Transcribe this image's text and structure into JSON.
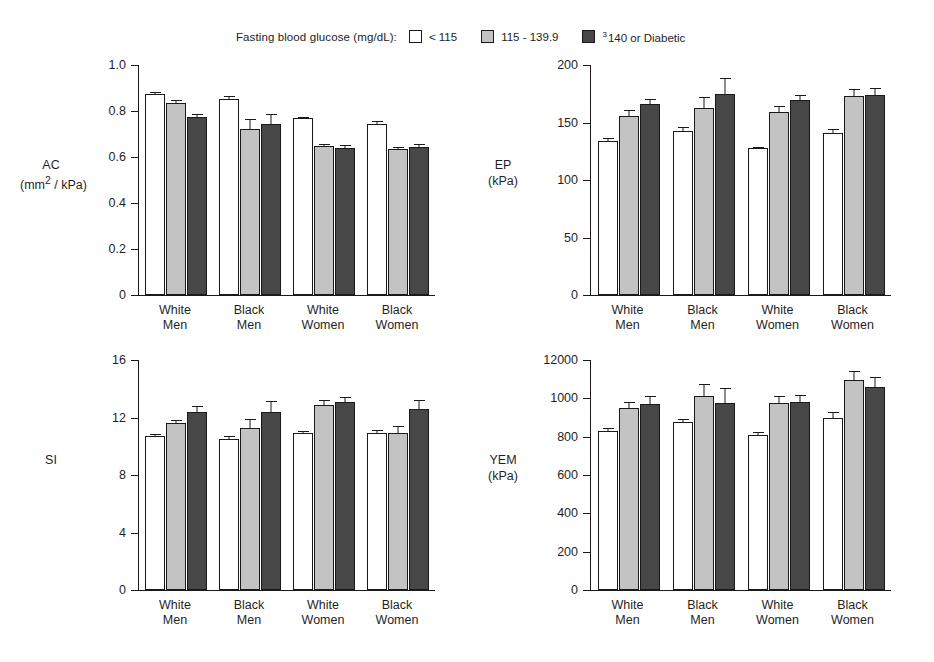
{
  "legend": {
    "title": "Fasting blood glucose (mg/dL):",
    "items": [
      {
        "label": "< 115",
        "color": "#ffffff",
        "name": "legend-swatch-low"
      },
      {
        "label": "115 - 139.9",
        "color": "#c3c3c3",
        "name": "legend-swatch-mid"
      },
      {
        "label": "140 or Diabetic",
        "prefix": "3",
        "color": "#474747",
        "name": "legend-swatch-high"
      }
    ]
  },
  "categories": [
    {
      "line1": "White",
      "line2": "Men"
    },
    {
      "line1": "Black",
      "line2": "Men"
    },
    {
      "line1": "White",
      "line2": "Women"
    },
    {
      "line1": "Black",
      "line2": "Women"
    }
  ],
  "chart_data": [
    {
      "id": "ac",
      "type": "bar",
      "title": "",
      "ylabel": "AC",
      "yunit": "(mm2 / kPa)",
      "yunit_html": "(mm<sup>2</sup> / kPa)",
      "xlabel": "",
      "ylim": [
        0,
        1.0
      ],
      "yticks": [
        0,
        0.2,
        0.4,
        0.6,
        0.8,
        1.0
      ],
      "ytick_labels": [
        "0",
        "0.2",
        "0.4",
        "0.6",
        "0.8",
        "1.0"
      ],
      "categories": [
        "White Men",
        "Black Men",
        "White Women",
        "Black Women"
      ],
      "series": [
        {
          "name": "< 115",
          "color": "#ffffff",
          "values": [
            0.875,
            0.852,
            0.768,
            0.745
          ],
          "errors": [
            0.012,
            0.018,
            0.012,
            0.015
          ]
        },
        {
          "name": "115 - 139.9",
          "color": "#c3c3c3",
          "values": [
            0.833,
            0.723,
            0.65,
            0.634
          ],
          "errors": [
            0.018,
            0.048,
            0.012,
            0.012
          ]
        },
        {
          "name": "140 or Diabetic",
          "color": "#474747",
          "values": [
            0.775,
            0.742,
            0.64,
            0.645
          ],
          "errors": [
            0.018,
            0.05,
            0.016,
            0.014
          ]
        }
      ],
      "grid": false
    },
    {
      "id": "ep",
      "type": "bar",
      "title": "",
      "ylabel": "EP",
      "yunit": "(kPa)",
      "xlabel": "",
      "ylim": [
        0,
        200
      ],
      "yticks": [
        0,
        50,
        100,
        150,
        200
      ],
      "ytick_labels": [
        "0",
        "50",
        "100",
        "150",
        "200"
      ],
      "categories": [
        "White Men",
        "Black Men",
        "White Women",
        "Black Women"
      ],
      "series": [
        {
          "name": "< 115",
          "color": "#ffffff",
          "values": [
            134,
            143,
            128,
            141
          ],
          "errors": [
            3,
            4,
            2,
            4
          ]
        },
        {
          "name": "115 - 139.9",
          "color": "#c3c3c3",
          "values": [
            156,
            163,
            159,
            173
          ],
          "errors": [
            6,
            10,
            6,
            7
          ]
        },
        {
          "name": "140 or Diabetic",
          "color": "#474747",
          "values": [
            166,
            175,
            170,
            174
          ],
          "errors": [
            5,
            15,
            5,
            7
          ]
        }
      ],
      "grid": false
    },
    {
      "id": "si",
      "type": "bar",
      "title": "",
      "ylabel": "SI",
      "yunit": "",
      "xlabel": "",
      "ylim": [
        0,
        16
      ],
      "yticks": [
        0,
        4,
        8,
        12,
        16
      ],
      "ytick_labels": [
        "0",
        "4",
        "8",
        "12",
        "16"
      ],
      "categories": [
        "White Men",
        "Black Men",
        "White Women",
        "Black Women"
      ],
      "series": [
        {
          "name": "< 115",
          "color": "#ffffff",
          "values": [
            10.7,
            10.5,
            10.9,
            10.9
          ],
          "errors": [
            0.2,
            0.3,
            0.2,
            0.3
          ]
        },
        {
          "name": "115 - 139.9",
          "color": "#c3c3c3",
          "values": [
            11.6,
            11.3,
            12.9,
            10.9
          ],
          "errors": [
            0.3,
            0.7,
            0.4,
            0.6
          ]
        },
        {
          "name": "140 or Diabetic",
          "color": "#474747",
          "values": [
            12.4,
            12.4,
            13.1,
            12.6
          ],
          "errors": [
            0.5,
            0.8,
            0.4,
            0.7
          ]
        }
      ],
      "grid": false
    },
    {
      "id": "yem",
      "type": "bar",
      "title": "",
      "ylabel": "YEM",
      "yunit": "(kPa)",
      "xlabel": "",
      "ylim": [
        0,
        1200
      ],
      "yticks": [
        0,
        200,
        400,
        600,
        800,
        1000,
        1200
      ],
      "ytick_labels": [
        "0",
        "200",
        "400",
        "600",
        "800",
        "1000",
        "12000"
      ],
      "categories": [
        "White Men",
        "Black Men",
        "White Women",
        "Black Women"
      ],
      "series": [
        {
          "name": "< 115",
          "color": "#ffffff",
          "values": [
            830,
            875,
            810,
            900
          ],
          "errors": [
            22,
            25,
            18,
            35
          ]
        },
        {
          "name": "115 - 139.9",
          "color": "#c3c3c3",
          "values": [
            950,
            1010,
            975,
            1095
          ],
          "errors": [
            35,
            70,
            45,
            55
          ]
        },
        {
          "name": "140 or Diabetic",
          "color": "#474747",
          "values": [
            970,
            975,
            980,
            1060
          ],
          "errors": [
            45,
            85,
            45,
            55
          ]
        }
      ],
      "grid": false
    }
  ]
}
